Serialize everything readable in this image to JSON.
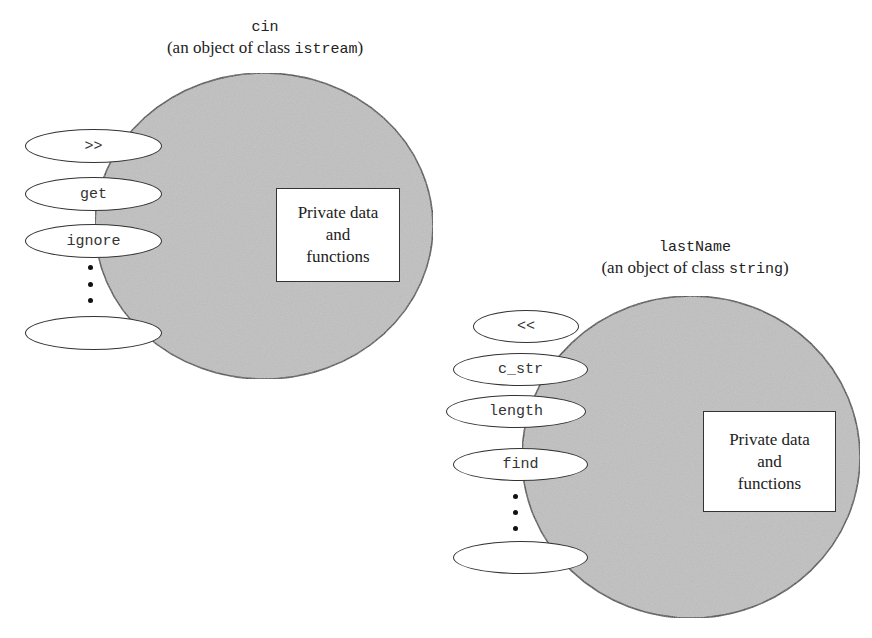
{
  "colors": {
    "circle_fill": "#b9b9b9",
    "stroke": "#333333",
    "background": "#ffffff"
  },
  "objects": [
    {
      "name": "cin",
      "subtitle_prefix": "(an object of class ",
      "class_name": "istream",
      "subtitle_suffix": ")",
      "private_box": [
        "Private data",
        "and",
        "functions"
      ],
      "methods": [
        ">>",
        "get",
        "ignore",
        ""
      ],
      "ellipsis": "⋮"
    },
    {
      "name": "lastName",
      "subtitle_prefix": "(an object of class ",
      "class_name": "string",
      "subtitle_suffix": ")",
      "private_box": [
        "Private data",
        "and",
        "functions"
      ],
      "methods": [
        "<<",
        "c_str",
        "length",
        "find",
        ""
      ],
      "ellipsis": "⋮"
    }
  ]
}
